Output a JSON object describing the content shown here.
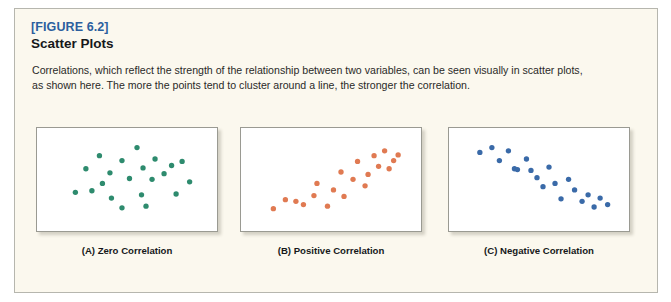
{
  "figure": {
    "label": "[FIGURE 6.2]",
    "title": "Scatter Plots",
    "description": "Correlations, which reflect the strength of the relationship between two variables, can be seen visually in scatter plots, as shown here. The more the points tend to cluster around a line, the stronger the correlation.",
    "label_color": "#2b5f9e",
    "panel_background": "#fbf8ee",
    "panel_border": "#b6b6ae"
  },
  "chart_data": [
    {
      "type": "scatter",
      "title": "(A) Zero Correlation",
      "caption": "(A) Zero Correlation",
      "point_color": "#2e8b6e",
      "xlabel": "",
      "ylabel": "",
      "xlim": [
        0,
        100
      ],
      "ylim": [
        0,
        100
      ],
      "grid": false,
      "legend": "none",
      "x": [
        31,
        56,
        46,
        68,
        79,
        22,
        38,
        60,
        74,
        86,
        51,
        66,
        91,
        15,
        26,
        39,
        59,
        82,
        46,
        62,
        33
      ],
      "y": [
        78,
        88,
        72,
        74,
        66,
        62,
        57,
        63,
        56,
        71,
        50,
        49,
        46,
        33,
        35,
        26,
        30,
        31,
        14,
        16,
        44
      ]
    },
    {
      "type": "scatter",
      "title": "(B) Positive Correlation",
      "caption": "(B) Positive Correlation",
      "point_color": "#e07a52",
      "xlabel": "",
      "ylabel": "",
      "xlim": [
        0,
        100
      ],
      "ylim": [
        0,
        100
      ],
      "grid": false,
      "legend": "none",
      "x": [
        11,
        19,
        26,
        31,
        38,
        40,
        47,
        51,
        56,
        58,
        64,
        67,
        72,
        74,
        78,
        81,
        85,
        88,
        91,
        94
      ],
      "y": [
        13,
        24,
        22,
        18,
        29,
        44,
        16,
        36,
        58,
        28,
        49,
        71,
        41,
        55,
        78,
        65,
        84,
        62,
        72,
        79
      ]
    },
    {
      "type": "scatter",
      "title": "(C) Negative Correlation",
      "caption": "(C) Negative Correlation",
      "point_color": "#3a6aa8",
      "xlabel": "",
      "ylabel": "",
      "xlim": [
        0,
        100
      ],
      "ylim": [
        0,
        100
      ],
      "grid": false,
      "legend": "none",
      "x": [
        10,
        18,
        23,
        29,
        33,
        35,
        41,
        44,
        48,
        52,
        56,
        60,
        64,
        69,
        73,
        78,
        82,
        86,
        90,
        95
      ],
      "y": [
        82,
        88,
        72,
        84,
        62,
        61,
        74,
        60,
        51,
        40,
        64,
        44,
        25,
        49,
        36,
        22,
        30,
        15,
        26,
        18
      ]
    }
  ]
}
